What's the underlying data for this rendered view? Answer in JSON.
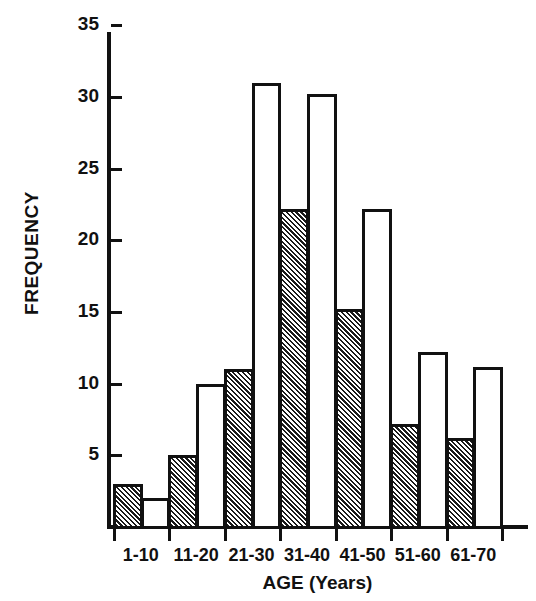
{
  "chart_data": {
    "type": "bar",
    "title": "",
    "subtitle": "",
    "xlabel": "AGE (Years)",
    "ylabel": "FREQUENCY",
    "categories": [
      "1-10",
      "11-20",
      "21-30",
      "31-40",
      "41-50",
      "51-60",
      "61-70"
    ],
    "series": [
      {
        "name": "hatched",
        "style": "hatched",
        "values": [
          3,
          5,
          11,
          22.2,
          15.2,
          7.2,
          6.2
        ]
      },
      {
        "name": "open",
        "style": "white",
        "values": [
          2,
          10,
          31,
          30.2,
          22.2,
          12.2,
          11.2
        ]
      }
    ],
    "ylim": [
      0,
      35
    ],
    "ytick_values": [
      5,
      10,
      15,
      20,
      25,
      30,
      35
    ],
    "ytick_labels": [
      "5",
      "10",
      "15",
      "20",
      "25",
      "30",
      "35"
    ],
    "xlim": [
      0,
      7
    ],
    "grid": false,
    "legend": false,
    "legend_position": "none",
    "bar_edge_color": "#111111",
    "bar_fill_open": "#ffffff",
    "bar_fill_hatched": "#1a1a1a",
    "axis_color": "#111111",
    "background_color": "#ffffff",
    "bars": [
      {
        "category": "1-10",
        "style": "hatched",
        "value": 3
      },
      {
        "category": "1-10",
        "style": "white",
        "value": 2
      },
      {
        "category": "11-20",
        "style": "hatched",
        "value": 5
      },
      {
        "category": "11-20",
        "style": "white",
        "value": 10
      },
      {
        "category": "21-30",
        "style": "hatched",
        "value": 11
      },
      {
        "category": "21-30",
        "style": "white",
        "value": 31
      },
      {
        "category": "31-40",
        "style": "hatched",
        "value": 22.2
      },
      {
        "category": "31-40",
        "style": "white",
        "value": 30.2
      },
      {
        "category": "41-50",
        "style": "hatched",
        "value": 15.2
      },
      {
        "category": "41-50",
        "style": "white",
        "value": 22.2
      },
      {
        "category": "51-60",
        "style": "hatched",
        "value": 7.2
      },
      {
        "category": "51-60",
        "style": "white",
        "value": 12.2
      },
      {
        "category": "61-70",
        "style": "hatched",
        "value": 6.2
      },
      {
        "category": "61-70",
        "style": "white",
        "value": 11.2
      }
    ]
  },
  "axes": {
    "y_label_text": "FREQUENCY",
    "x_label_text": "AGE (Years)"
  }
}
